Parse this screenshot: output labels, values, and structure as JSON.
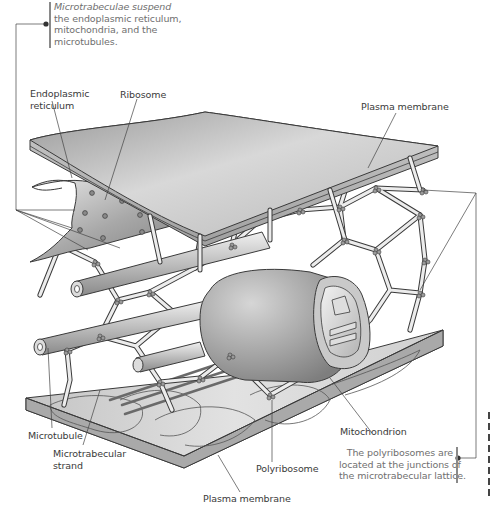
{
  "figure": {
    "labels": {
      "endoplasmic_reticulum_line1": "Endoplasmic",
      "endoplasmic_reticulum_line2": "reticulum",
      "ribosome": "Ribosome",
      "plasma_membrane_top": "Plasma membrane",
      "microtubule": "Microtubule",
      "microtrabecular_strand_line1": "Microtrabecular",
      "microtrabecular_strand_line2": "strand",
      "polyribosome": "Polyribosome",
      "mitochondrion": "Mitochondrion",
      "plasma_membrane_bottom": "Plasma membrane"
    },
    "callouts": {
      "top_note": {
        "lines": [
          "Microtrabeculae suspend",
          "the endoplasmic reticulum,",
          "mitochondria, and the",
          "microtubules."
        ]
      },
      "bottom_note": {
        "lines": [
          "The polyribosomes are",
          "located at the junctions of",
          "the microtrabecular lattice."
        ]
      }
    },
    "colors": {
      "line": "#3a3a3a",
      "membrane_light": "#e8e8e8",
      "membrane_dark": "#a9a9a9",
      "strand": "#e6e6e6",
      "note_text": "#6f6f6f",
      "label_text": "#3a3a3a"
    }
  }
}
